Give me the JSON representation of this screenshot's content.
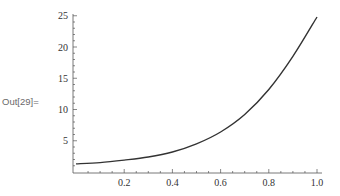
{
  "cell": {
    "out_label": "Out[29]="
  },
  "chart_data": {
    "type": "line",
    "title": "",
    "xlabel": "",
    "ylabel": "",
    "xlim": [
      0,
      1.0
    ],
    "ylim": [
      0,
      25
    ],
    "x_ticks": [
      "0.2",
      "0.4",
      "0.6",
      "0.8",
      "1.0"
    ],
    "y_ticks": [
      "5",
      "10",
      "15",
      "20",
      "25"
    ],
    "grid": false,
    "legend": null,
    "series": [
      {
        "name": "curve",
        "color": "#333333",
        "x": [
          0,
          0.1,
          0.2,
          0.3,
          0.4,
          0.5,
          0.6,
          0.7,
          0.8,
          0.9,
          1.0
        ],
        "y": [
          1.3,
          1.5,
          1.9,
          2.4,
          3.2,
          4.5,
          6.4,
          9.2,
          13.2,
          18.5,
          24.8
        ]
      }
    ]
  }
}
